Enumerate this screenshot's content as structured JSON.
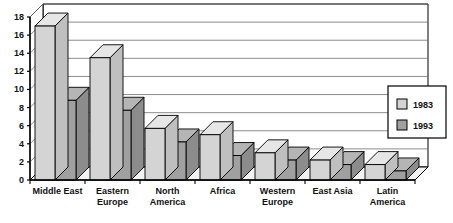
{
  "chart_data": {
    "type": "bar",
    "title": "",
    "subtitle": "",
    "xlabel": "",
    "ylabel": "",
    "ylim": [
      0,
      18
    ],
    "ytick_step": 2,
    "yticks": [
      "0",
      "2",
      "4",
      "6",
      "8",
      "10",
      "12",
      "14",
      "16",
      "18"
    ],
    "grid": true,
    "grid_axis": "y",
    "style": "3d-clustered-column",
    "legend_position": "right",
    "categories": [
      "Middle East",
      "Eastern Europe",
      "North America",
      "Africa",
      "Western Europe",
      "East Asia",
      "Latin America"
    ],
    "series": [
      {
        "name": "1983",
        "color": "#d4d4d4",
        "values": [
          17.0,
          13.5,
          5.7,
          5.0,
          3.0,
          2.2,
          1.7
        ]
      },
      {
        "name": "1993",
        "color": "#a0a0a0",
        "values": [
          8.8,
          7.7,
          4.2,
          2.7,
          2.2,
          1.7,
          1.0
        ]
      }
    ]
  },
  "legend": {
    "entries": [
      {
        "label": "1983",
        "swatch_color": "#d4d4d4"
      },
      {
        "label": "1993",
        "swatch_color": "#a0a0a0"
      }
    ]
  },
  "colors": {
    "series_1983": "#d4d4d4",
    "series_1993": "#a0a0a0",
    "series_1983_side": "#bfbfbf",
    "series_1993_side": "#8c8c8c",
    "series_1983_top": "#e6e6e6",
    "series_1993_top": "#b5b5b5",
    "axis": "#000000",
    "gridline": "#6e6e6e",
    "background": "#ffffff",
    "floor": "#f2f2f2",
    "text": "#111111"
  }
}
